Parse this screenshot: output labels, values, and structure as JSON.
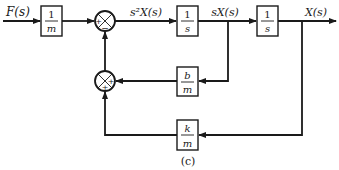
{
  "diagram": {
    "caption": "(c)",
    "input_label": "F(s)",
    "signals": {
      "accel": "s²X(s)",
      "vel": "sX(s)",
      "pos": "X(s)"
    },
    "blocks": [
      {
        "id": "gain-inv-m",
        "num": "1",
        "den": "m"
      },
      {
        "id": "integrator-1",
        "num": "1",
        "den": "s"
      },
      {
        "id": "integrator-2",
        "num": "1",
        "den": "s"
      },
      {
        "id": "damping-gain",
        "num": "b",
        "den": "m"
      },
      {
        "id": "spring-gain",
        "num": "k",
        "den": "m"
      }
    ],
    "junctions": [
      {
        "id": "sum-main",
        "signs": {
          "left": "+",
          "bottom": "−"
        }
      },
      {
        "id": "sum-feedback",
        "signs": {
          "right": "+",
          "bottom": "+"
        }
      }
    ]
  }
}
